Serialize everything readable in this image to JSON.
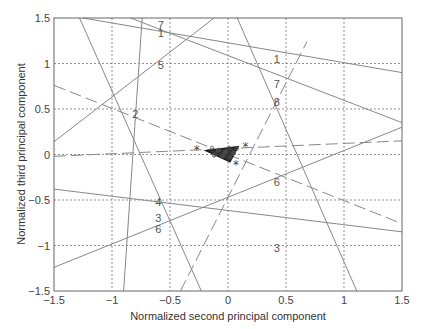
{
  "chart_data": {
    "type": "line",
    "title": "",
    "xlabel": "Normalized second principal component",
    "ylabel": "Normalized third principal component",
    "xlim": [
      -1.5,
      1.5
    ],
    "ylim": [
      -1.5,
      1.5
    ],
    "grid": true,
    "xticks": [
      "-1.5",
      "-1",
      "-0.5",
      "0",
      "0.5",
      "1",
      "1.5"
    ],
    "yticks": [
      "1.5",
      "1",
      "0.5",
      "0",
      "-0.5",
      "-1",
      "-1.5"
    ],
    "line_labels": [
      {
        "text": "7",
        "x": -0.58,
        "y": 1.42
      },
      {
        "text": "1",
        "x": -0.58,
        "y": 1.33
      },
      {
        "text": "1",
        "x": 0.42,
        "y": 1.05
      },
      {
        "text": "5",
        "x": -0.58,
        "y": 0.98
      },
      {
        "text": "7",
        "x": 0.42,
        "y": 0.78
      },
      {
        "text": "8",
        "x": 0.42,
        "y": 0.58
      },
      {
        "text": "2",
        "x": -0.8,
        "y": 0.45
      },
      {
        "text": "6",
        "x": 0.42,
        "y": -0.3
      },
      {
        "text": "4",
        "x": -0.6,
        "y": -0.52
      },
      {
        "text": "3",
        "x": -0.6,
        "y": -0.7
      },
      {
        "text": "6",
        "x": -0.6,
        "y": -0.82
      },
      {
        "text": "3",
        "x": 0.42,
        "y": -1.03
      }
    ],
    "series": [
      {
        "name": "line-a",
        "style": "solid",
        "points": [
          [
            -1.28,
            1.5
          ],
          [
            -0.23,
            -1.5
          ]
        ]
      },
      {
        "name": "line-b",
        "style": "solid",
        "points": [
          [
            -0.74,
            1.5
          ],
          [
            -0.9,
            -1.5
          ]
        ]
      },
      {
        "name": "line-5",
        "style": "solid",
        "points": [
          [
            -1.5,
            0.14
          ],
          [
            -0.12,
            1.5
          ]
        ]
      },
      {
        "name": "line-1",
        "style": "solid",
        "points": [
          [
            -1.25,
            1.5
          ],
          [
            1.5,
            0.9
          ]
        ]
      },
      {
        "name": "line-7",
        "style": "solid",
        "points": [
          [
            -0.84,
            1.5
          ],
          [
            1.5,
            0.35
          ]
        ]
      },
      {
        "name": "line-8",
        "style": "solid",
        "points": [
          [
            0.08,
            1.5
          ],
          [
            1.11,
            -1.5
          ]
        ]
      },
      {
        "name": "line-6",
        "style": "solid",
        "points": [
          [
            -1.5,
            -1.24
          ],
          [
            1.5,
            0.3
          ]
        ]
      },
      {
        "name": "line-3",
        "style": "solid",
        "points": [
          [
            -1.5,
            -0.38
          ],
          [
            1.5,
            -0.85
          ]
        ]
      },
      {
        "name": "dashed-decreasing",
        "style": "dashed",
        "points": [
          [
            -1.5,
            0.76
          ],
          [
            1.5,
            -0.76
          ]
        ]
      },
      {
        "name": "dashed-flat",
        "style": "dashed",
        "points": [
          [
            -1.5,
            -0.02
          ],
          [
            1.5,
            0.15
          ]
        ]
      },
      {
        "name": "dashed-steep",
        "style": "dashed",
        "points": [
          [
            -0.41,
            -1.5
          ],
          [
            0.68,
            1.24
          ]
        ]
      }
    ],
    "markers": [
      {
        "symbol": "*",
        "x": -0.27,
        "y": 0.05
      },
      {
        "symbol": "*",
        "x": 0.15,
        "y": 0.08
      },
      {
        "symbol": "*",
        "x": 0.07,
        "y": -0.12
      }
    ],
    "cluster": {
      "center_x": 0.0,
      "center_y": 0.02,
      "description": "dense cluster of points near origin"
    }
  }
}
